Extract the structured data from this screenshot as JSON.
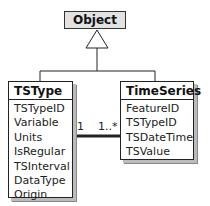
{
  "diagram": {
    "superclass": {
      "name": "Object",
      "fill": "#e2e2e2"
    },
    "classes": [
      {
        "name": "TSType",
        "attributes": [
          "TSTypeID",
          "Variable",
          "Units",
          "IsRegular",
          "TSInterval",
          "DataType",
          "Origin"
        ]
      },
      {
        "name": "TimeSeries",
        "attributes": [
          "FeatureID",
          "TSTypeID",
          "TSDateTime",
          "TSValue"
        ]
      }
    ],
    "association": {
      "from": "TSType",
      "to": "TimeSeries",
      "from_multiplicity": "1",
      "to_multiplicity": "1..*"
    },
    "generalization": {
      "parent": "Object",
      "children": [
        "TSType",
        "TimeSeries"
      ]
    }
  }
}
